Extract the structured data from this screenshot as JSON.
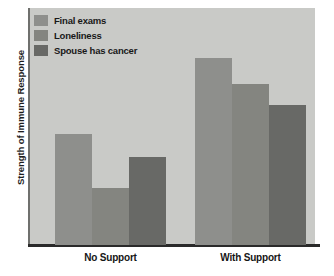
{
  "chart_data": {
    "type": "bar",
    "title": "",
    "xlabel": "",
    "ylabel": "Strength of Immune Response",
    "categories": [
      "No Support",
      "With Support"
    ],
    "series": [
      {
        "name": "Final exams",
        "color": "#8e8f8c",
        "values": [
          47,
          79
        ]
      },
      {
        "name": "Loneliness",
        "color": "#848580",
        "values": [
          24,
          68
        ]
      },
      {
        "name": "Spouse has cancer",
        "color": "#686966",
        "values": [
          37,
          59
        ]
      }
    ],
    "ylim": [
      0,
      100
    ],
    "y_ticks_shown": false,
    "grid": false,
    "legend_position": "top-left",
    "plot_background": "#c9cac7",
    "axis_color": "#2a2a2a"
  },
  "legend": {
    "items": [
      {
        "label": "Final exams"
      },
      {
        "label": "Loneliness"
      },
      {
        "label": "Spouse has cancer"
      }
    ]
  },
  "axes": {
    "y_title": "Strength of Immune Response",
    "x_labels": [
      "No Support",
      "With Support"
    ]
  }
}
